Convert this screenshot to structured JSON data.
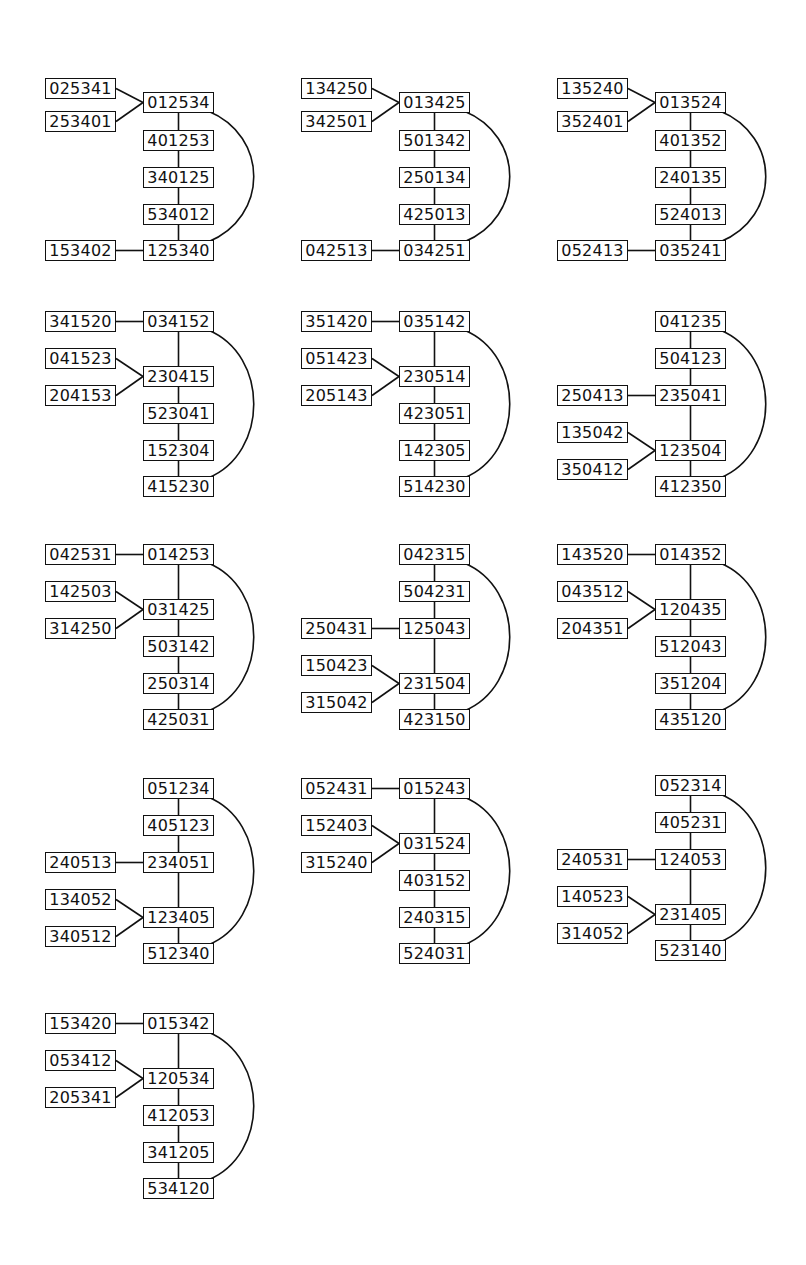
{
  "diagrams": [
    {
      "origin": [
        45,
        78
      ],
      "chain": [
        {
          "label": "012534",
          "y": 14
        },
        {
          "label": "401253",
          "y": 52
        },
        {
          "label": "340125",
          "y": 89
        },
        {
          "label": "534012",
          "y": 126
        },
        {
          "label": "125340",
          "y": 162
        }
      ],
      "attached": [
        {
          "label": "025341",
          "y": 0,
          "to": 0
        },
        {
          "label": "253401",
          "y": 33,
          "to": 0
        },
        {
          "label": "153402",
          "y": 162,
          "to": 4
        }
      ]
    },
    {
      "origin": [
        301,
        78
      ],
      "chain": [
        {
          "label": "013425",
          "y": 14
        },
        {
          "label": "501342",
          "y": 52
        },
        {
          "label": "250134",
          "y": 89
        },
        {
          "label": "425013",
          "y": 126
        },
        {
          "label": "034251",
          "y": 162
        }
      ],
      "attached": [
        {
          "label": "134250",
          "y": 0,
          "to": 0
        },
        {
          "label": "342501",
          "y": 33,
          "to": 0
        },
        {
          "label": "042513",
          "y": 162,
          "to": 4
        }
      ]
    },
    {
      "origin": [
        557,
        78
      ],
      "chain": [
        {
          "label": "013524",
          "y": 14
        },
        {
          "label": "401352",
          "y": 52
        },
        {
          "label": "240135",
          "y": 89
        },
        {
          "label": "524013",
          "y": 126
        },
        {
          "label": "035241",
          "y": 162
        }
      ],
      "attached": [
        {
          "label": "135240",
          "y": 0,
          "to": 0
        },
        {
          "label": "352401",
          "y": 33,
          "to": 0
        },
        {
          "label": "052413",
          "y": 162,
          "to": 4
        }
      ]
    },
    {
      "origin": [
        45,
        311
      ],
      "chain": [
        {
          "label": "034152",
          "y": 0
        },
        {
          "label": "230415",
          "y": 55
        },
        {
          "label": "523041",
          "y": 92
        },
        {
          "label": "152304",
          "y": 129
        },
        {
          "label": "415230",
          "y": 165
        }
      ],
      "attached": [
        {
          "label": "341520",
          "y": 0,
          "to": 0
        },
        {
          "label": "041523",
          "y": 37,
          "to": 1
        },
        {
          "label": "204153",
          "y": 74,
          "to": 1
        }
      ]
    },
    {
      "origin": [
        301,
        311
      ],
      "chain": [
        {
          "label": "035142",
          "y": 0
        },
        {
          "label": "230514",
          "y": 55
        },
        {
          "label": "423051",
          "y": 92
        },
        {
          "label": "142305",
          "y": 129
        },
        {
          "label": "514230",
          "y": 165
        }
      ],
      "attached": [
        {
          "label": "351420",
          "y": 0,
          "to": 0
        },
        {
          "label": "051423",
          "y": 37,
          "to": 1
        },
        {
          "label": "205143",
          "y": 74,
          "to": 1
        }
      ]
    },
    {
      "origin": [
        557,
        311
      ],
      "chain": [
        {
          "label": "041235",
          "y": 0
        },
        {
          "label": "504123",
          "y": 37
        },
        {
          "label": "235041",
          "y": 74
        },
        {
          "label": "123504",
          "y": 129
        },
        {
          "label": "412350",
          "y": 165
        }
      ],
      "attached": [
        {
          "label": "250413",
          "y": 74,
          "to": 2
        },
        {
          "label": "135042",
          "y": 111,
          "to": 3
        },
        {
          "label": "350412",
          "y": 148,
          "to": 3
        }
      ]
    },
    {
      "origin": [
        45,
        544
      ],
      "chain": [
        {
          "label": "014253",
          "y": 0
        },
        {
          "label": "031425",
          "y": 55
        },
        {
          "label": "503142",
          "y": 92
        },
        {
          "label": "250314",
          "y": 129
        },
        {
          "label": "425031",
          "y": 165
        }
      ],
      "attached": [
        {
          "label": "042531",
          "y": 0,
          "to": 0
        },
        {
          "label": "142503",
          "y": 37,
          "to": 1
        },
        {
          "label": "314250",
          "y": 74,
          "to": 1
        }
      ]
    },
    {
      "origin": [
        301,
        544
      ],
      "chain": [
        {
          "label": "042315",
          "y": 0
        },
        {
          "label": "504231",
          "y": 37
        },
        {
          "label": "125043",
          "y": 74
        },
        {
          "label": "231504",
          "y": 129
        },
        {
          "label": "423150",
          "y": 165
        }
      ],
      "attached": [
        {
          "label": "250431",
          "y": 74,
          "to": 2
        },
        {
          "label": "150423",
          "y": 111,
          "to": 3
        },
        {
          "label": "315042",
          "y": 148,
          "to": 3
        }
      ]
    },
    {
      "origin": [
        557,
        544
      ],
      "chain": [
        {
          "label": "014352",
          "y": 0
        },
        {
          "label": "120435",
          "y": 55
        },
        {
          "label": "512043",
          "y": 92
        },
        {
          "label": "351204",
          "y": 129
        },
        {
          "label": "435120",
          "y": 165
        }
      ],
      "attached": [
        {
          "label": "143520",
          "y": 0,
          "to": 0
        },
        {
          "label": "043512",
          "y": 37,
          "to": 1
        },
        {
          "label": "204351",
          "y": 74,
          "to": 1
        }
      ]
    },
    {
      "origin": [
        45,
        778
      ],
      "chain": [
        {
          "label": "051234",
          "y": 0
        },
        {
          "label": "405123",
          "y": 37
        },
        {
          "label": "234051",
          "y": 74
        },
        {
          "label": "123405",
          "y": 129
        },
        {
          "label": "512340",
          "y": 165
        }
      ],
      "attached": [
        {
          "label": "240513",
          "y": 74,
          "to": 2
        },
        {
          "label": "134052",
          "y": 111,
          "to": 3
        },
        {
          "label": "340512",
          "y": 148,
          "to": 3
        }
      ]
    },
    {
      "origin": [
        301,
        778
      ],
      "chain": [
        {
          "label": "015243",
          "y": 0
        },
        {
          "label": "031524",
          "y": 55
        },
        {
          "label": "403152",
          "y": 92
        },
        {
          "label": "240315",
          "y": 129
        },
        {
          "label": "524031",
          "y": 165
        }
      ],
      "attached": [
        {
          "label": "052431",
          "y": 0,
          "to": 0
        },
        {
          "label": "152403",
          "y": 37,
          "to": 1
        },
        {
          "label": "315240",
          "y": 74,
          "to": 1
        }
      ]
    },
    {
      "origin": [
        557,
        775
      ],
      "chain": [
        {
          "label": "052314",
          "y": 0
        },
        {
          "label": "405231",
          "y": 37
        },
        {
          "label": "124053",
          "y": 74
        },
        {
          "label": "231405",
          "y": 129
        },
        {
          "label": "523140",
          "y": 165
        }
      ],
      "attached": [
        {
          "label": "240531",
          "y": 74,
          "to": 2
        },
        {
          "label": "140523",
          "y": 111,
          "to": 3
        },
        {
          "label": "314052",
          "y": 148,
          "to": 3
        }
      ]
    },
    {
      "origin": [
        45,
        1013
      ],
      "chain": [
        {
          "label": "015342",
          "y": 0
        },
        {
          "label": "120534",
          "y": 55
        },
        {
          "label": "412053",
          "y": 92
        },
        {
          "label": "341205",
          "y": 129
        },
        {
          "label": "534120",
          "y": 165
        }
      ],
      "attached": [
        {
          "label": "153420",
          "y": 0,
          "to": 0
        },
        {
          "label": "053412",
          "y": 37,
          "to": 1
        },
        {
          "label": "205341",
          "y": 74,
          "to": 1
        }
      ]
    }
  ],
  "style": {
    "stroke": "#111111",
    "background": "#ffffff"
  }
}
